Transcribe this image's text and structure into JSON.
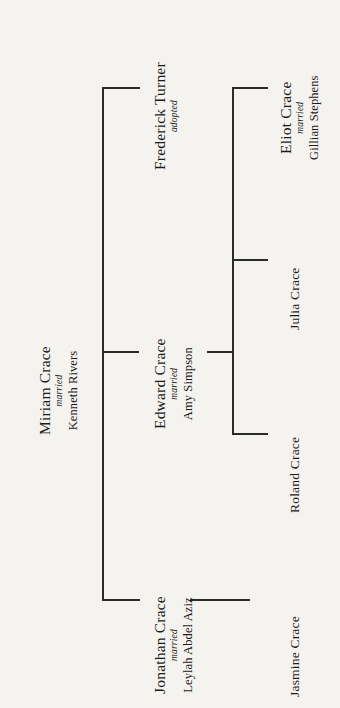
{
  "diagram": {
    "orientation": "rotated-90-ccw",
    "background_color": "#f4f3ef",
    "line_color": "#2a2a2a",
    "generations": [
      {
        "label": "generation-1",
        "people": [
          {
            "id": "miriam-crace",
            "name": "Miriam Crace",
            "relation_label": "married",
            "spouse": "Kenneth Rivers"
          }
        ]
      },
      {
        "label": "generation-2",
        "people": [
          {
            "id": "frederick-turner",
            "name": "Frederick Turner",
            "relation_label": "adopted",
            "spouse": ""
          },
          {
            "id": "edward-crace",
            "name": "Edward Crace",
            "relation_label": "married",
            "spouse": "Amy Simpson"
          },
          {
            "id": "jonathan-crace",
            "name": "Jonathan Crace",
            "relation_label": "married",
            "spouse": "Leylah Abdel Aziz"
          }
        ]
      },
      {
        "label": "generation-3",
        "people": [
          {
            "id": "eliot-crace",
            "name": "Eliot Crace",
            "relation_label": "married",
            "spouse": "Gillian Stephens"
          },
          {
            "id": "julia-crace",
            "name": "Julia Crace",
            "relation_label": "",
            "spouse": ""
          },
          {
            "id": "roland-crace",
            "name": "Roland Crace",
            "relation_label": "",
            "spouse": ""
          },
          {
            "id": "jasmine-crace",
            "name": "Jasmine Crace",
            "relation_label": "",
            "spouse": ""
          }
        ]
      }
    ]
  }
}
